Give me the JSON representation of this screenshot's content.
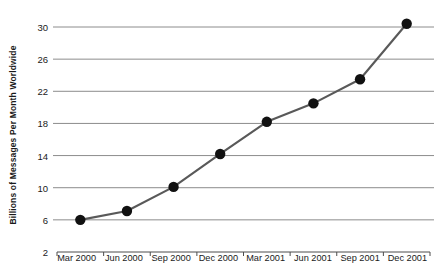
{
  "chart_data": {
    "type": "line",
    "title": "",
    "subtitle": "",
    "xlabel": "",
    "ylabel": "Billions of Messages Per Month Worldwide",
    "categories": [
      "Mar 2000",
      "Jun 2000",
      "Sep 2000",
      "Dec 2000",
      "Mar 2001",
      "Jun 2001",
      "Sep 2001",
      "Dec 2001"
    ],
    "values": [
      6.0,
      7.1,
      10.1,
      14.2,
      18.2,
      20.5,
      23.5,
      30.4
    ],
    "series": [
      {
        "name": "Messages Per Month Worldwide",
        "values": [
          6.0,
          7.1,
          10.1,
          14.2,
          18.2,
          20.5,
          23.5,
          30.4
        ]
      }
    ],
    "ylim": [
      2,
      30
    ],
    "y_ticks": [
      2,
      6,
      10,
      14,
      18,
      22,
      26,
      30
    ],
    "y_tick_labels": [
      "2",
      "6",
      "10",
      "14",
      "18",
      "22",
      "26",
      "30"
    ],
    "grid": "horizontal",
    "legend": "none",
    "marker": "filled-circle",
    "colors": {
      "line": "#595959",
      "marker": "#111111",
      "gridline": "#8c8c8c",
      "axis": "#4d4d4d",
      "text": "#1a1a1a",
      "background": "#ffffff"
    }
  }
}
